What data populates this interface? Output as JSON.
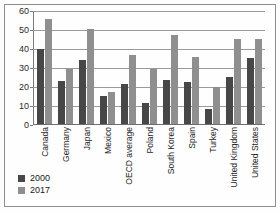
{
  "chart_data": {
    "type": "bar",
    "title": "",
    "subtitle": "",
    "xlabel": "",
    "ylabel": "",
    "ylim": [
      0,
      60
    ],
    "yticks": [
      0,
      10,
      20,
      30,
      40,
      50,
      60
    ],
    "grid": true,
    "legend_position": "bottom-left",
    "categories": [
      "Canada",
      "Germany",
      "Japan",
      "Mexico",
      "OECD average",
      "Poland",
      "South Korea",
      "Spain",
      "Turkey",
      "United Kingdom",
      "United States"
    ],
    "series": [
      {
        "name": "2000",
        "color": "#474747",
        "values": [
          40,
          23,
          34,
          15,
          21,
          11,
          23.5,
          22.5,
          8,
          25,
          35
        ]
      },
      {
        "name": "2017",
        "color": "#8f8f8f",
        "values": [
          56,
          29,
          50.5,
          17,
          36.5,
          29,
          47,
          35.5,
          19.5,
          45,
          45
        ]
      }
    ]
  },
  "legend": {
    "items": [
      {
        "label": "2000",
        "color": "#474747"
      },
      {
        "label": "2017",
        "color": "#8f8f8f"
      }
    ]
  }
}
